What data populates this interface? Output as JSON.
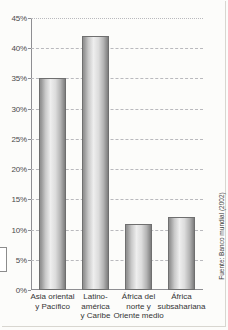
{
  "chart_data": {
    "type": "bar",
    "title": "",
    "subtitle": "",
    "xlabel": "",
    "ylabel": "",
    "grid": true,
    "legend": null,
    "ylim": [
      0,
      45
    ],
    "ytick_step": 5,
    "ytick_labels": [
      "45%",
      "40%",
      "35%",
      "30%",
      "25%",
      "20%",
      "15%",
      "10%",
      "5%",
      "0%"
    ],
    "ytick_values": [
      45,
      40,
      35,
      30,
      25,
      20,
      15,
      10,
      5,
      0
    ],
    "categories": [
      "Asia oriental y Pacífico",
      "Latinoamérica y Caribe",
      "África del norte y Oriente medio",
      "África subsahariana"
    ],
    "category_lines": [
      [
        "Asia oriental",
        "y Pacífico"
      ],
      [
        "Latino-",
        "américa",
        "y Caribe"
      ],
      [
        "África del",
        "norte y",
        "Oriente medio"
      ],
      [
        "África",
        "subsahariana"
      ]
    ],
    "values": [
      35,
      42,
      11,
      12
    ],
    "value_unit": "%",
    "source": "Fuente: Banco mundial (2002)"
  },
  "figure": {
    "source_note": "Fuente: Banco mundial (2002)"
  },
  "colors": {
    "bar_light": "#eeeeee",
    "bar_dark": "#7d7d7d",
    "bar_outline": "#6f6f6f",
    "axis": "#8e8e92",
    "grid": "#b9b9bd",
    "text": "#343434",
    "page": "#fcfcfa"
  }
}
